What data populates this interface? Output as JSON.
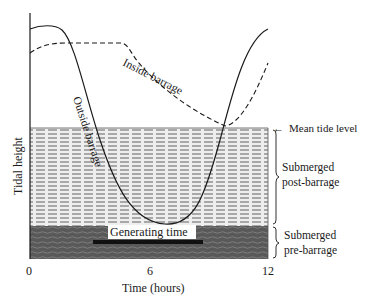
{
  "diagram": {
    "y_axis_label": "Tidal height",
    "x_axis_label": "Time (hours)",
    "x_ticks": [
      "0",
      "6",
      "12"
    ],
    "curves": {
      "outside": "Outside barrage",
      "inside": "Inside barrage"
    },
    "annotations": {
      "mean_tide_level": "Mean tide level",
      "generating_time": "Generating time",
      "post_line1": "Submerged",
      "post_line2": "post-barrage",
      "pre_line1": "Submerged",
      "pre_line2": "pre-barrage"
    },
    "arrow_glyph": "←"
  },
  "colors": {
    "ink": "#1a1a1a",
    "hatch_light_bg": "#ededed",
    "hatch_light_line": "#7a7a7a",
    "dark_region_bg": "#5a5a5a",
    "dark_region_line": "#808080"
  }
}
